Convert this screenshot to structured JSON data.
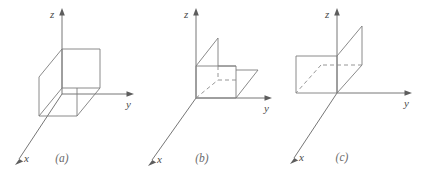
{
  "figure": {
    "background_color": "#ffffff",
    "line_color": "#7d7d7d",
    "axis_color": "#676767",
    "label_color": "#4a4a4a",
    "panel_count": 3
  },
  "panels": [
    {
      "id": "a",
      "caption": "(a)",
      "shape_description": "cube",
      "axes": {
        "x": {
          "label": "x",
          "direction": "down-left"
        },
        "y": {
          "label": "y",
          "direction": "right"
        },
        "z": {
          "label": "z",
          "direction": "up"
        }
      },
      "origin": {
        "x": 62,
        "y": 94
      }
    },
    {
      "id": "b",
      "caption": "(b)",
      "shape_description": "step-solid",
      "axes": {
        "x": {
          "label": "x",
          "direction": "down-left"
        },
        "y": {
          "label": "y",
          "direction": "right"
        },
        "z": {
          "label": "z",
          "direction": "up"
        }
      },
      "origin": {
        "x": 56,
        "y": 98
      }
    },
    {
      "id": "c",
      "caption": "(c)",
      "shape_description": "planar-region",
      "axes": {
        "x": {
          "label": "x",
          "direction": "down-left"
        },
        "y": {
          "label": "y",
          "direction": "right"
        },
        "z": {
          "label": "z",
          "direction": "up"
        }
      },
      "origin": {
        "x": 57,
        "y": 93
      }
    }
  ]
}
